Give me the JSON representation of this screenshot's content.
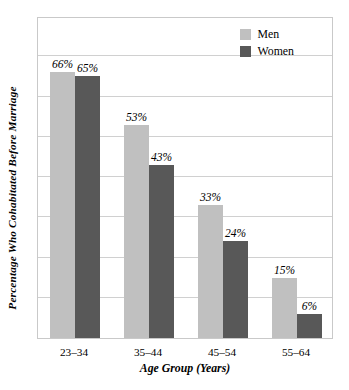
{
  "chart_data": {
    "type": "bar",
    "title": "",
    "xlabel": "Age Group (Years)",
    "ylabel": "Percentage Who Cohabitated Before Marriage",
    "categories": [
      "23–34",
      "35–44",
      "45–54",
      "55–64"
    ],
    "series": [
      {
        "name": "Men",
        "color": "#c0c0c0",
        "values": [
          66,
          53,
          33,
          15
        ],
        "labels": [
          "66%",
          "53%",
          "33%",
          "15%"
        ]
      },
      {
        "name": "Women",
        "color": "#585858",
        "values": [
          65,
          43,
          24,
          6
        ],
        "labels": [
          "65%",
          "43%",
          "24%",
          "6%"
        ]
      }
    ],
    "ylim": [
      0,
      80
    ],
    "grid": true,
    "gridline_values": [
      10,
      20,
      30,
      40,
      50,
      60,
      70
    ],
    "y_tick_labels_visible": false,
    "legend_position": "top-right"
  },
  "legend": {
    "items": [
      {
        "label": "Men",
        "color": "#c0c0c0"
      },
      {
        "label": "Women",
        "color": "#585858"
      }
    ]
  },
  "axes": {
    "x_title": "Age Group (Years)",
    "y_title": "Percentage Who Cohabitated Before Marriage",
    "x_tick_labels": [
      "23–34",
      "35–44",
      "45–54",
      "55–64"
    ]
  },
  "colors": {
    "men_bar": "#c0c0c0",
    "women_bar": "#585858",
    "frame": "#c9c9c9",
    "gridline": "#d0d0d0",
    "background": "#ffffff",
    "text": "#000000"
  }
}
